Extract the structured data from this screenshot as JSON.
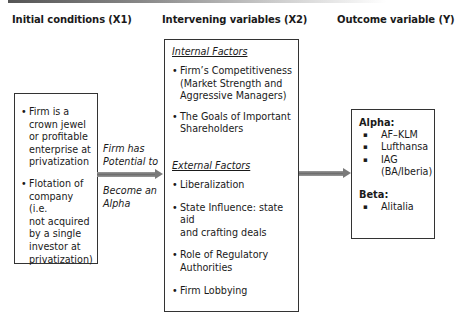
{
  "headings": {
    "x1": "Initial conditions (X1)",
    "x2": "Intervening variables (X2)",
    "y": "Outcome variable (Y)"
  },
  "initial_conditions": {
    "items": [
      "Firm is a crown jewel or profitable enterprise at privatization",
      "Flotation of company (i.e. not acquired by a single investor at privatization)"
    ],
    "items_lines": [
      [
        "Firm is a",
        "crown jewel",
        "or profitable",
        "enterprise at",
        "privatization"
      ],
      [
        "Flotation of",
        "company (i.e.",
        "not acquired",
        "by a single",
        "investor at",
        "privatization)"
      ]
    ]
  },
  "arrow1": {
    "label_above": [
      "Firm has",
      "Potential to"
    ],
    "label_below": [
      "Become an",
      "Alpha"
    ]
  },
  "intervening": {
    "internal": {
      "title": "Internal Factors",
      "items": [
        [
          "Firm’s Competitiveness",
          "(Market Strength and",
          "Aggressive Managers)"
        ],
        [
          "The Goals of Important",
          "Shareholders"
        ]
      ]
    },
    "external": {
      "title": "External Factors",
      "items": [
        [
          "Liberalization"
        ],
        [
          "State Influence: state aid",
          "and crafting deals"
        ],
        [
          "Role of Regulatory",
          "Authorities"
        ],
        [
          "Firm Lobbying"
        ]
      ]
    }
  },
  "outcome": {
    "alpha": {
      "title": "Alpha:",
      "items": [
        [
          "AF–KLM"
        ],
        [
          "Lufthansa"
        ],
        [
          "IAG",
          "(BA/Iberia)"
        ]
      ]
    },
    "beta": {
      "title": "Beta:",
      "items": [
        [
          "Alitalia"
        ]
      ]
    }
  },
  "colors": {
    "arrow": "#7a7a7a",
    "border": "#333333",
    "text": "#1a1a1a"
  }
}
